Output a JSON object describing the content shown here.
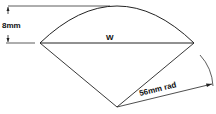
{
  "diagram": {
    "height_label": "8mm",
    "chord_label": "W",
    "radius_label": "56mm rad",
    "colors": {
      "line": "#222222",
      "background": "#ffffff"
    }
  }
}
